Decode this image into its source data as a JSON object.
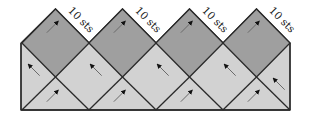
{
  "diagram": {
    "title": "",
    "colors": {
      "dark": "#9f9f9f",
      "light": "#d2d2d2",
      "stroke": "#2a2a2a",
      "arrow": "#111111",
      "arrow_tail": "#6a6a6a"
    },
    "geometry": {
      "left": 21,
      "right": 290,
      "top": 9,
      "mid": 43,
      "lower": 77,
      "bottom": 110,
      "diamond_half_width": 33.6
    },
    "dark_diamonds": [
      {
        "cx": 55.5,
        "label": "10 sts",
        "arrow": "up-right"
      },
      {
        "cx": 122.5,
        "label": "10 sts",
        "arrow": "up-right"
      },
      {
        "cx": 189.5,
        "label": "10 sts",
        "arrow": "up-right"
      },
      {
        "cx": 256.5,
        "label": "10 sts",
        "arrow": "up-right"
      }
    ],
    "light_mid_arrows": [
      {
        "x": 34,
        "y": 70,
        "direction": "up-left",
        "position": "left-edge"
      },
      {
        "x": 96,
        "y": 70,
        "direction": "up-left"
      },
      {
        "x": 163,
        "y": 70,
        "direction": "up-left"
      },
      {
        "x": 230,
        "y": 70,
        "direction": "up-left"
      },
      {
        "x": 279,
        "y": 84,
        "direction": "up-left",
        "position": "right-edge"
      }
    ],
    "bottom_arrows": [
      {
        "x": 55.5,
        "y": 96,
        "direction": "up-right"
      },
      {
        "x": 122.5,
        "y": 96,
        "direction": "up-right"
      },
      {
        "x": 189.5,
        "y": 96,
        "direction": "up-right"
      },
      {
        "x": 256.5,
        "y": 96,
        "direction": "up-right"
      }
    ]
  }
}
